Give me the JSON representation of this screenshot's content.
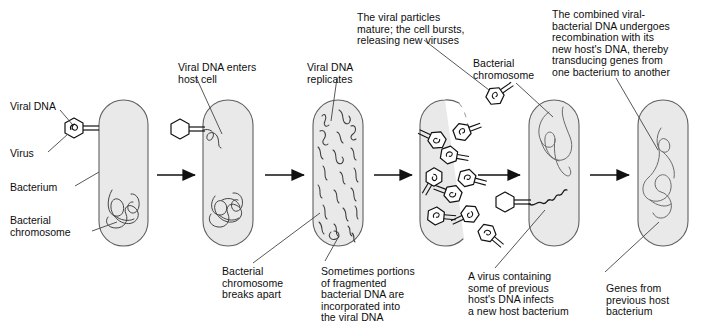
{
  "figure": {
    "type": "biology-process-diagram",
    "steps": 6,
    "colors": {
      "cell_fill": "#e8e8e8",
      "cell_stroke": "#555555",
      "dna_stroke": "#444444",
      "virus_stroke": "#111111",
      "text": "#0d0d0d",
      "arrow": "#111111",
      "leader_line": "#555555",
      "background": "#ffffff"
    }
  },
  "labels": {
    "viral_dna": "Viral DNA",
    "virus": "Virus",
    "bacterium": "Bacterium",
    "bacterial_chromosome": "Bacterial\nchromosome",
    "bacterial_chromosome_right": "Bacterial\nchromosome"
  },
  "captions": {
    "step2": "Viral DNA enters\nhost cell",
    "step3": "Viral DNA\nreplicates",
    "step3_breaks": "Bacterial\nchromosome\nbreaks apart",
    "step3_incorporated": "Sometimes portions\nof fragmented\nbacterial DNA are\nincorporated into\nthe viral DNA",
    "step4": "The viral particles\nmature; the cell bursts,\nreleasing new viruses",
    "step5": "A virus containing\nsome of previous\nhost's DNA infects\na new host bacterium",
    "step6": "The combined viral-\nbacterial DNA undergoes\nrecombination with its\nnew host's DNA, thereby\ntransducing genes from\none bacterium to another",
    "step6_genes": "Genes from\nprevious host\nbacterium"
  },
  "cells": [
    {
      "name": "cell-1-uninfected-bacterium",
      "x": 99,
      "y": 100,
      "w": 49,
      "h": 146
    },
    {
      "name": "cell-2-infected-bacterium",
      "x": 203,
      "y": 100,
      "w": 50,
      "h": 146
    },
    {
      "name": "cell-3-replicating-viral-dna",
      "x": 313,
      "y": 100,
      "w": 50,
      "h": 146
    },
    {
      "name": "cell-4-bursting-cell",
      "x": 420,
      "y": 100,
      "w": 50,
      "h": 146
    },
    {
      "name": "cell-5-new-host-bacterium",
      "x": 529,
      "y": 100,
      "w": 50,
      "h": 146
    },
    {
      "name": "cell-6-transduced-bacterium",
      "x": 638,
      "y": 100,
      "w": 50,
      "h": 146
    }
  ],
  "arrows": [
    {
      "name": "arrow-1",
      "x1": 157,
      "x2": 196,
      "y": 175
    },
    {
      "name": "arrow-2",
      "x1": 265,
      "x2": 305,
      "y": 175
    },
    {
      "name": "arrow-3",
      "x1": 374,
      "x2": 413,
      "y": 175
    },
    {
      "name": "arrow-4",
      "x1": 478,
      "x2": 521,
      "y": 175
    },
    {
      "name": "arrow-5",
      "x1": 590,
      "x2": 630,
      "y": 175
    }
  ],
  "viruses": [
    {
      "name": "virus-attaching-cell-1",
      "x": 74,
      "y": 128,
      "r": 10,
      "tail": "right",
      "angle": 0
    },
    {
      "name": "virus-attaching-cell-2",
      "x": 180,
      "y": 129,
      "r": 10,
      "tail": "right",
      "angle": 0
    },
    {
      "name": "virus-attaching-cell-5",
      "x": 505,
      "y": 202,
      "r": 10,
      "tail": "right",
      "angle": 0
    },
    {
      "name": "virus-released-top",
      "x": 495,
      "y": 96,
      "r": 9,
      "tail": "upright",
      "angle": -35
    },
    {
      "name": "virus-in-cell-a",
      "x": 437,
      "y": 140,
      "r": 9,
      "tail": "downleft",
      "angle": 205
    },
    {
      "name": "virus-in-cell-b",
      "x": 462,
      "y": 132,
      "r": 9,
      "tail": "right",
      "angle": -20
    },
    {
      "name": "virus-in-cell-c",
      "x": 449,
      "y": 155,
      "r": 9,
      "tail": "right",
      "angle": 10
    },
    {
      "name": "virus-in-cell-d",
      "x": 434,
      "y": 177,
      "r": 9,
      "tail": "down",
      "angle": 120
    },
    {
      "name": "virus-in-cell-e",
      "x": 467,
      "y": 178,
      "r": 9,
      "tail": "right",
      "angle": 15
    },
    {
      "name": "virus-in-cell-f",
      "x": 453,
      "y": 194,
      "r": 9,
      "tail": "upleft",
      "angle": 200
    },
    {
      "name": "virus-in-cell-g",
      "x": 436,
      "y": 216,
      "r": 9,
      "tail": "right",
      "angle": 5
    },
    {
      "name": "virus-in-cell-h",
      "x": 470,
      "y": 214,
      "r": 9,
      "tail": "downleft",
      "angle": 155
    },
    {
      "name": "virus-escaping-i",
      "x": 487,
      "y": 233,
      "r": 9,
      "tail": "downright",
      "angle": 40
    }
  ]
}
